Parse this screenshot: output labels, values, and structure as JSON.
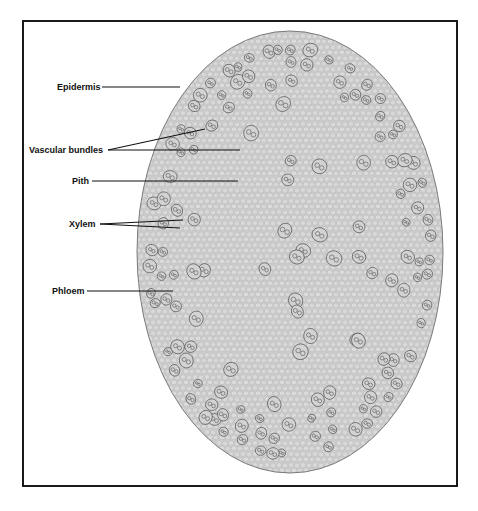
{
  "diagram": {
    "type": "stem-cross-section",
    "colors": {
      "frame": "#1a1a1a",
      "tissue_fill": "#cdcdcd",
      "cell_fill": "#dadada",
      "cell_stroke": "#b4b4b4",
      "outline": "#7a7a7a",
      "bundle_stroke": "#555555",
      "leader_line": "#111111",
      "label_text": "#111111"
    },
    "stem": {
      "cx": 290,
      "cy": 252,
      "rx": 153,
      "ry": 221
    },
    "labels": [
      {
        "id": "epidermis",
        "text": "Epidermis",
        "x": 57,
        "y": 82,
        "lines": [
          {
            "x1": 102,
            "y1": 87,
            "x2": 180,
            "y2": 87
          }
        ]
      },
      {
        "id": "vascular-bundles",
        "text": "Vascular bundles",
        "x": 29,
        "y": 145,
        "lines": [
          {
            "x1": 108,
            "y1": 150,
            "x2": 205,
            "y2": 129
          },
          {
            "x1": 108,
            "y1": 150,
            "x2": 240,
            "y2": 150
          }
        ]
      },
      {
        "id": "pith",
        "text": "Pith",
        "x": 72,
        "y": 176,
        "lines": [
          {
            "x1": 92,
            "y1": 181,
            "x2": 238,
            "y2": 181
          }
        ]
      },
      {
        "id": "xylem",
        "text": "Xylem",
        "x": 69,
        "y": 219,
        "lines": [
          {
            "x1": 100,
            "y1": 224,
            "x2": 183,
            "y2": 220
          },
          {
            "x1": 100,
            "y1": 224,
            "x2": 180,
            "y2": 228
          }
        ]
      },
      {
        "id": "phloem",
        "text": "Phloem",
        "x": 52,
        "y": 286,
        "lines": [
          {
            "x1": 87,
            "y1": 291,
            "x2": 173,
            "y2": 291
          }
        ]
      }
    ]
  }
}
